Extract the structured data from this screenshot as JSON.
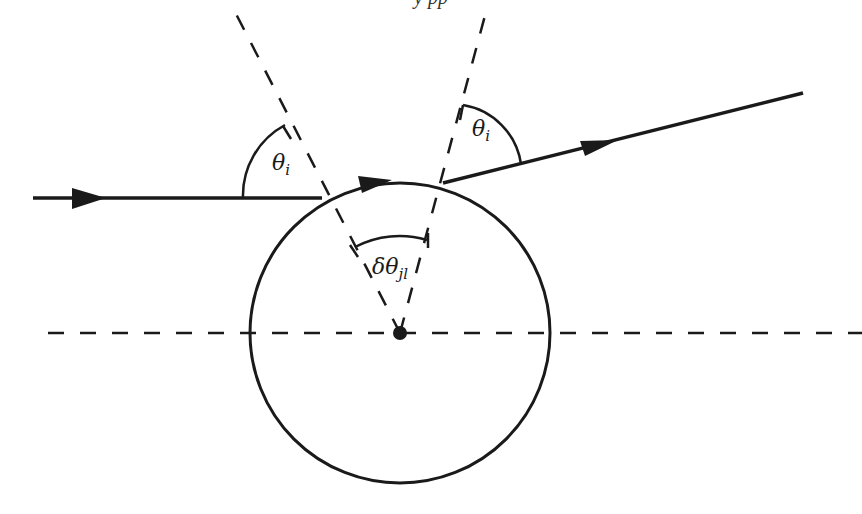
{
  "header": {
    "text": "y     pp"
  },
  "labels": {
    "theta_left": "θ",
    "theta_left_sub": "i",
    "theta_right": "θ",
    "theta_right_sub": "i",
    "delta_theta": "δθ",
    "delta_theta_sub": "jl"
  },
  "geometry": {
    "circle": {
      "cx": 400,
      "cy": 333,
      "r": 150
    },
    "axis_y": 333,
    "incoming_ray": {
      "x1": 33,
      "y1": 198,
      "x2": 322,
      "y2": 198
    },
    "outgoing_ray": {
      "x1": 443,
      "y1": 183,
      "x2": 803,
      "y2": 93
    },
    "normal_left_top": {
      "x": 233,
      "y": 8
    },
    "normal_right_top": {
      "x": 487,
      "y": 8
    }
  },
  "colors": {
    "stroke": "#1a1a1a",
    "background": "#ffffff"
  }
}
